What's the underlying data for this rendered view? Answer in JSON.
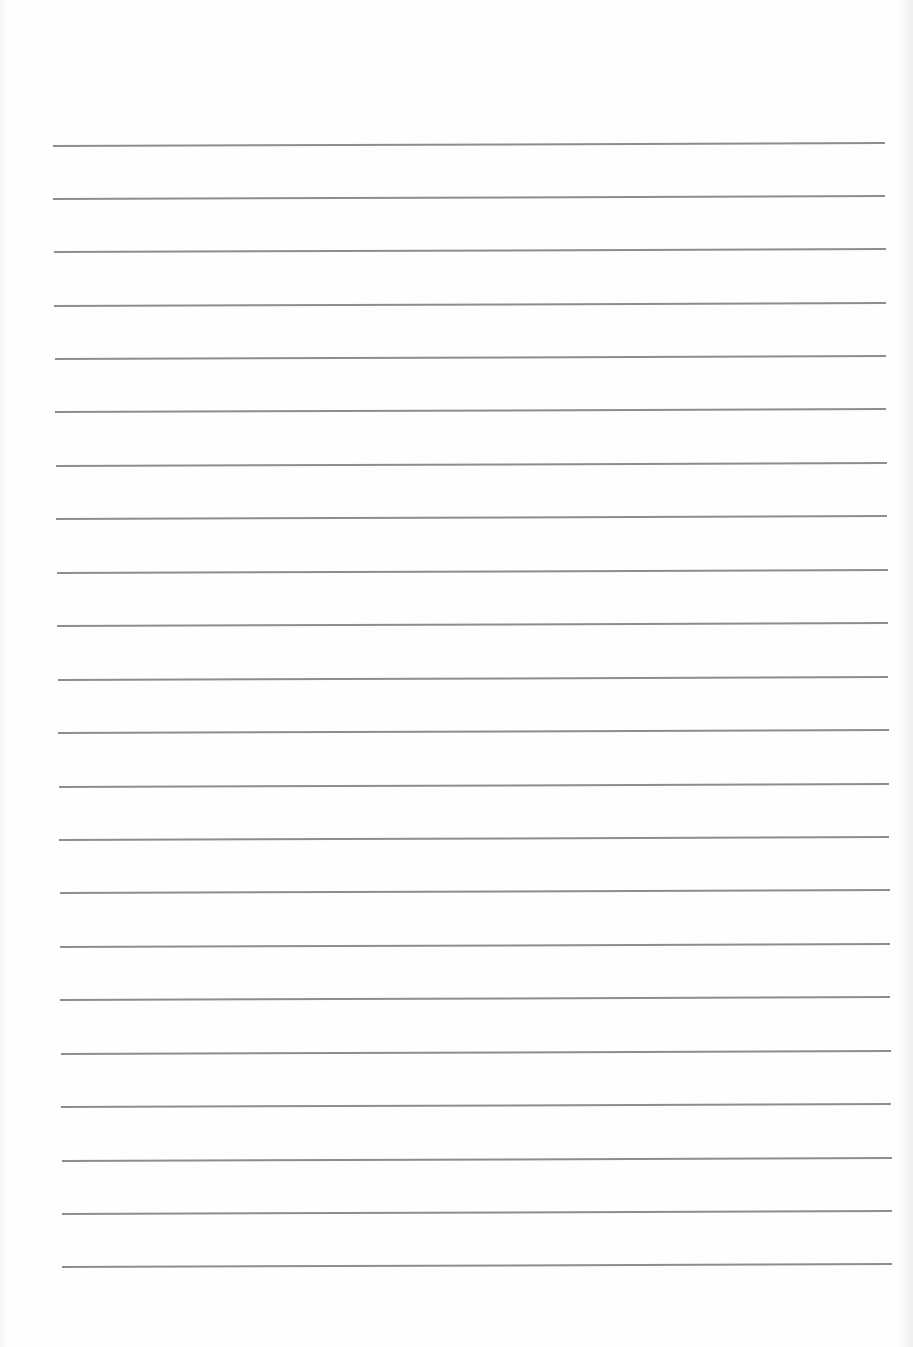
{
  "document": {
    "type": "lined-paper",
    "background_color": "#fefefe",
    "line_color": "#8d8d8d",
    "line_count": 22,
    "text_content": ""
  },
  "ruled_lines": [
    {
      "y": 145,
      "x1": 53,
      "x2": 885
    },
    {
      "y": 198,
      "x1": 53,
      "x2": 885
    },
    {
      "y": 251,
      "x1": 54,
      "x2": 886
    },
    {
      "y": 305,
      "x1": 54,
      "x2": 886
    },
    {
      "y": 358,
      "x1": 55,
      "x2": 886
    },
    {
      "y": 411,
      "x1": 55,
      "x2": 886
    },
    {
      "y": 465,
      "x1": 56,
      "x2": 887
    },
    {
      "y": 518,
      "x1": 56,
      "x2": 887
    },
    {
      "y": 572,
      "x1": 57,
      "x2": 888
    },
    {
      "y": 625,
      "x1": 57,
      "x2": 888
    },
    {
      "y": 679,
      "x1": 58,
      "x2": 888
    },
    {
      "y": 732,
      "x1": 58,
      "x2": 889
    },
    {
      "y": 786,
      "x1": 59,
      "x2": 889
    },
    {
      "y": 839,
      "x1": 59,
      "x2": 889
    },
    {
      "y": 892,
      "x1": 60,
      "x2": 890
    },
    {
      "y": 946,
      "x1": 60,
      "x2": 890
    },
    {
      "y": 999,
      "x1": 60,
      "x2": 890
    },
    {
      "y": 1053,
      "x1": 61,
      "x2": 891
    },
    {
      "y": 1106,
      "x1": 61,
      "x2": 891
    },
    {
      "y": 1160,
      "x1": 62,
      "x2": 892
    },
    {
      "y": 1213,
      "x1": 62,
      "x2": 892
    },
    {
      "y": 1266,
      "x1": 62,
      "x2": 892
    }
  ]
}
